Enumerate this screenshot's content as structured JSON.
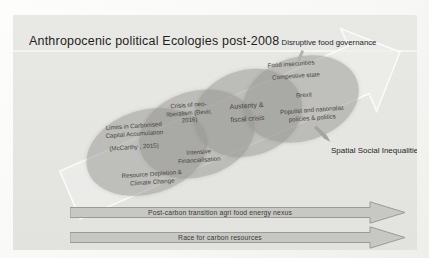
{
  "title": "Anthropocenic political Ecologies post-2008",
  "annotations": {
    "disruptive_food_governance": "Disruptive food governance",
    "spatial_social_inequalities": "Spatial Social Inequalities"
  },
  "ellipses": {
    "carbon_limits": {
      "heading": "Limits in Carbonised Capital Accumulation",
      "citation": "(McCarthy , 2015)",
      "sub": "Resource Depletion & Climate Change"
    },
    "neoliberal_crisis": {
      "heading": "Crisis of neo-liberalism (Bevir, 2016)",
      "sub": "Intensive Financialisation"
    },
    "austerity": {
      "heading": "Austerity & fiscal crisis"
    },
    "food_politics": {
      "line1": "Food insecurities",
      "line2": "Competitive state",
      "line3": "Brexit",
      "line4": "Populist and nationalist policies & politics"
    }
  },
  "banner_arrows": [
    {
      "label": "Post-carbon transition agri food energy nexus"
    },
    {
      "label": "Race for carbon resources"
    }
  ],
  "colors": {
    "slide_bg": "#e6e6e3",
    "ellipse_fill": "#c4c4c1",
    "banner_fill": "#c7c7c4",
    "banner_border": "#9a9a97",
    "text": "#3f3f3d"
  }
}
